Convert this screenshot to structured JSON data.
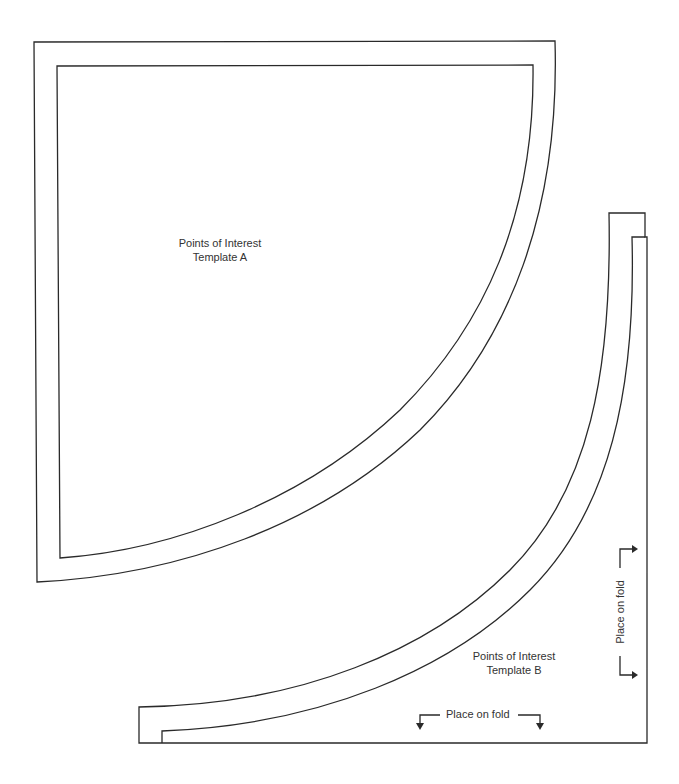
{
  "template_a": {
    "title_line1": "Points of Interest",
    "title_line2": "Template A"
  },
  "template_b": {
    "title_line1": "Points of Interest",
    "title_line2": "Template B",
    "fold_bottom_label": "Place on fold",
    "fold_side_label": "Place on fold"
  },
  "colors": {
    "stroke": "#2a2a2a",
    "text": "#333333",
    "background": "#ffffff"
  }
}
